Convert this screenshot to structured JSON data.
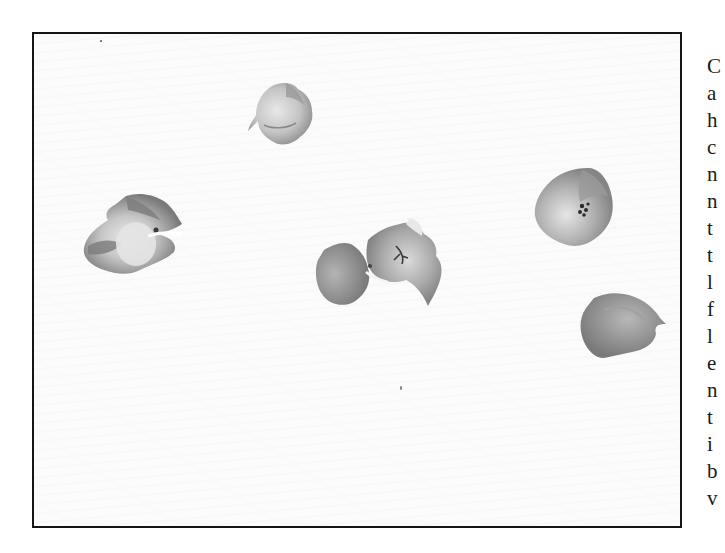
{
  "figure": {
    "flowers": [
      {
        "id": "flower-top-center",
        "label": "single blossom"
      },
      {
        "id": "flower-left",
        "label": "open blossom with petals"
      },
      {
        "id": "flower-center-cluster",
        "label": "pair of blossoms"
      },
      {
        "id": "flower-right-upper",
        "label": "open blossom with stamens"
      },
      {
        "id": "flower-right-lower",
        "label": "closed blossom"
      }
    ]
  },
  "side_text": {
    "lines": [
      "C",
      "a",
      "h",
      "c",
      "n",
      "n",
      "t",
      "t",
      "l",
      "f",
      "l",
      "e",
      "n",
      "t",
      "i",
      "b",
      "v"
    ]
  }
}
